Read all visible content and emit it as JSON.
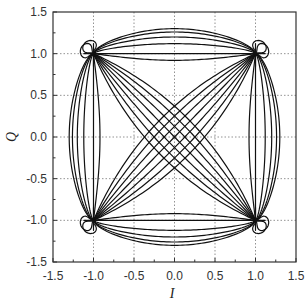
{
  "chart_data": {
    "type": "line",
    "title": "",
    "xlabel": "I",
    "ylabel": "Q",
    "xlim": [
      -1.5,
      1.5
    ],
    "ylim": [
      -1.5,
      1.5
    ],
    "grid": true,
    "legend": null,
    "x_ticks": [
      "-1.5",
      "-1.0",
      "-0.5",
      "0.0",
      "0.5",
      "1.0",
      "1.5"
    ],
    "y_ticks": [
      "-1.5",
      "-1.0",
      "-0.5",
      "0.0",
      "0.5",
      "1.0",
      "1.5"
    ],
    "constellation_points": [
      {
        "I": 1.0,
        "Q": 1.0
      },
      {
        "I": -1.0,
        "Q": 1.0
      },
      {
        "I": -1.0,
        "Q": -1.0
      },
      {
        "I": 1.0,
        "Q": -1.0
      }
    ],
    "diagonal_offsets": [
      -0.12,
      -0.08,
      -0.04,
      0.0,
      0.04,
      0.08,
      0.12
    ],
    "edge_bulge_max": 1.3
  }
}
